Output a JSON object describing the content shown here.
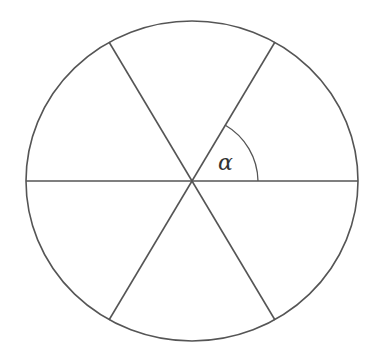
{
  "diagram": {
    "angle_label": "α",
    "sector_count": 6,
    "angle_marked": "angle between horizontal diameter and upper-right spoke",
    "colors": {
      "stroke": "#555555",
      "background": "#ffffff",
      "label": "#333333"
    }
  }
}
